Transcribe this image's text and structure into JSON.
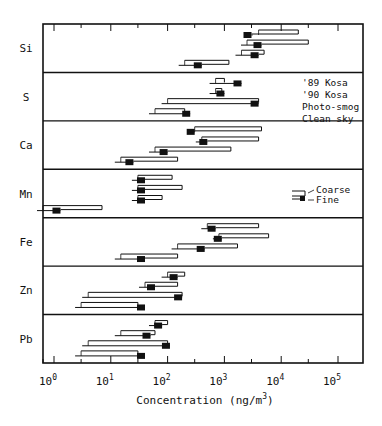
{
  "chart_data": {
    "type": "bar",
    "subtype": "horizontal-range-log",
    "title": "",
    "xlabel": "Concentration (ng/m3)",
    "xlabel_base": "Concentration (ng/m",
    "xlabel_sup": "3",
    "xlabel_close": ")",
    "ylabel": "",
    "xscale": "log",
    "xlim": [
      0.6,
      200000
    ],
    "x_tick_labels": [
      {
        "base": "10",
        "exp": "0",
        "value": 1
      },
      {
        "base": "10",
        "exp": "1",
        "value": 10
      },
      {
        "base": "10",
        "exp": "2",
        "value": 100
      },
      {
        "base": "10",
        "exp": "3",
        "value": 1000
      },
      {
        "base": "10",
        "exp": "4",
        "value": 10000
      },
      {
        "base": "10",
        "exp": "5",
        "value": 100000
      }
    ],
    "conditions_legend": [
      "'89 Kosa",
      "'90 Kosa",
      "Photo-smog",
      "Clean sky"
    ],
    "bar_key": {
      "coarse": "Coarse",
      "fine": "Fine"
    },
    "categories": [
      "Si",
      "S",
      "Ca",
      "Mn",
      "Fe",
      "Zn",
      "Pb"
    ],
    "series": [
      {
        "element": "Si",
        "rows": [
          {
            "condition": "'89 Kosa",
            "start": 4000,
            "coarse": 20000,
            "fine": 3000
          },
          {
            "condition": "'90 Kosa",
            "start": 2500,
            "coarse": 30000,
            "fine": 4500
          },
          {
            "condition": "Photo-smog",
            "start": 2000,
            "coarse": 5000,
            "fine": 4000
          },
          {
            "condition": "Clean sky",
            "start": 200,
            "coarse": 1200,
            "fine": 400
          }
        ]
      },
      {
        "element": "S",
        "rows": [
          {
            "condition": "'89 Kosa",
            "start": 700,
            "coarse": 1000,
            "fine": 2000
          },
          {
            "condition": "'90 Kosa",
            "start": 700,
            "coarse": 900,
            "fine": 1000
          },
          {
            "condition": "Photo-smog",
            "start": 100,
            "coarse": 4000,
            "fine": 4000
          },
          {
            "condition": "Clean sky",
            "start": 60,
            "coarse": 200,
            "fine": 250
          }
        ]
      },
      {
        "element": "Ca",
        "rows": [
          {
            "condition": "'89 Kosa",
            "start": 300,
            "coarse": 4500,
            "fine": 300
          },
          {
            "condition": "'90 Kosa",
            "start": 400,
            "coarse": 4000,
            "fine": 500
          },
          {
            "condition": "Photo-smog",
            "start": 60,
            "coarse": 1300,
            "fine": 100
          },
          {
            "condition": "Clean sky",
            "start": 15,
            "coarse": 150,
            "fine": 25
          }
        ]
      },
      {
        "element": "Mn",
        "rows": [
          {
            "condition": "'89 Kosa",
            "start": 30,
            "coarse": 120,
            "fine": 40
          },
          {
            "condition": "'90 Kosa",
            "start": 30,
            "coarse": 180,
            "fine": 40
          },
          {
            "condition": "Photo-smog",
            "start": 30,
            "coarse": 80,
            "fine": 40
          },
          {
            "condition": "Clean sky",
            "start": 0.6,
            "coarse": 7,
            "fine": 1.3
          }
        ]
      },
      {
        "element": "Fe",
        "rows": [
          {
            "condition": "'89 Kosa",
            "start": 500,
            "coarse": 4000,
            "fine": 700
          },
          {
            "condition": "'90 Kosa",
            "start": 800,
            "coarse": 6000,
            "fine": 900
          },
          {
            "condition": "Photo-smog",
            "start": 150,
            "coarse": 1700,
            "fine": 450
          },
          {
            "condition": "Clean sky",
            "start": 15,
            "coarse": 150,
            "fine": 40
          }
        ]
      },
      {
        "element": "Zn",
        "rows": [
          {
            "condition": "'89 Kosa",
            "start": 100,
            "coarse": 200,
            "fine": 150
          },
          {
            "condition": "'90 Kosa",
            "start": 40,
            "coarse": 150,
            "fine": 60
          },
          {
            "condition": "Photo-smog",
            "start": 4,
            "coarse": 180,
            "fine": 180
          },
          {
            "condition": "Clean sky",
            "start": 3,
            "coarse": 30,
            "fine": 40
          }
        ]
      },
      {
        "element": "Pb",
        "rows": [
          {
            "condition": "'89 Kosa",
            "start": 60,
            "coarse": 100,
            "fine": 80
          },
          {
            "condition": "'90 Kosa",
            "start": 15,
            "coarse": 60,
            "fine": 50
          },
          {
            "condition": "Photo-smog",
            "start": 4,
            "coarse": 100,
            "fine": 110
          },
          {
            "condition": "Clean sky",
            "start": 3,
            "coarse": 30,
            "fine": 40
          }
        ]
      }
    ],
    "grid": false,
    "legend_position": "inside-right"
  }
}
